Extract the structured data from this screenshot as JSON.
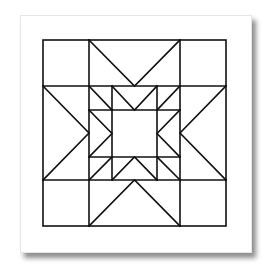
{
  "diagram": {
    "stroke_color": "#111111",
    "background_color": "#ffffff",
    "outer_square": [
      43,
      40,
      226,
      226
    ],
    "grid_x": [
      43,
      89,
      180,
      226
    ],
    "grid_y": [
      40,
      86,
      180,
      226
    ],
    "inner_x": [
      89,
      112,
      157,
      180
    ],
    "inner_y": [
      86,
      110,
      157,
      180
    ]
  }
}
